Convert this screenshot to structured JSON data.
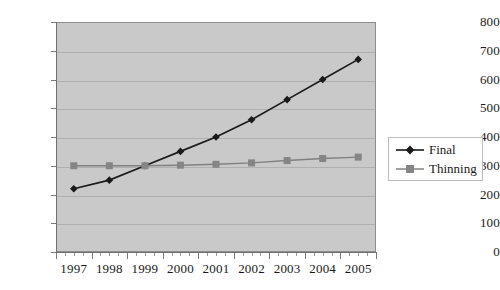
{
  "chart_data": {
    "type": "line",
    "title": "",
    "subtitle": "",
    "xlabel": "",
    "ylabel": "",
    "categories": [
      "1997",
      "1998",
      "1999",
      "2000",
      "2001",
      "2002",
      "2003",
      "2004",
      "2005"
    ],
    "series": [
      {
        "name": "Final",
        "marker": "diamond",
        "color": "#1a1a1a",
        "values": [
          220,
          250,
          300,
          350,
          400,
          460,
          530,
          600,
          670
        ]
      },
      {
        "name": "Thinning",
        "marker": "square",
        "color": "#808080",
        "values": [
          300,
          300,
          300,
          302,
          305,
          310,
          318,
          325,
          330
        ]
      }
    ],
    "ylim": [
      0,
      800
    ],
    "yticks": [
      0,
      100,
      200,
      300,
      400,
      500,
      600,
      700,
      800
    ],
    "ytick_labels": [
      "0",
      "100",
      "200",
      "300",
      "400",
      "500",
      "600",
      "700",
      "800"
    ],
    "grid": "horizontal",
    "plot_background": "#c9c9c9",
    "legend": {
      "position": "right",
      "entries": [
        "Final",
        "Thinning"
      ]
    }
  }
}
